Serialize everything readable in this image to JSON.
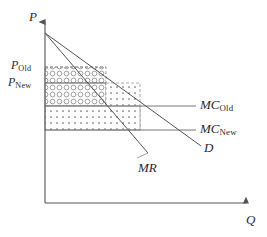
{
  "figure": {
    "type": "economics-supply-demand-diagram",
    "width": 267,
    "height": 237,
    "background_color": "#ffffff",
    "line_color": "#555555",
    "text_color": "#2b2b2b"
  },
  "axes": {
    "y_label": "P",
    "x_label": "Q",
    "origin": {
      "x": 45,
      "y": 203
    },
    "y_top": {
      "x": 45,
      "y": 18
    },
    "x_right": {
      "x": 250,
      "y": 203
    }
  },
  "curves": [
    {
      "name": "demand",
      "label": "D",
      "label_sub": "",
      "from": {
        "x": 45,
        "y": 33
      },
      "to": {
        "x": 201,
        "y": 146
      },
      "label_pos": {
        "x": 205,
        "y": 142
      }
    },
    {
      "name": "marginal-revenue",
      "label": "MR",
      "label_sub": "",
      "from": {
        "x": 45,
        "y": 33
      },
      "to": {
        "x": 148,
        "y": 153
      },
      "label_pos": {
        "x": 139,
        "y": 163
      }
    },
    {
      "name": "marginal-cost-old",
      "label": "MC",
      "label_sub": "Old",
      "y": 106,
      "from_x": 45,
      "to_x": 196,
      "label_pos": {
        "x": 200,
        "y": 99
      }
    },
    {
      "name": "marginal-cost-new",
      "label": "MC",
      "label_sub": "New",
      "y": 130,
      "from_x": 45,
      "to_x": 196,
      "label_pos": {
        "x": 200,
        "y": 123
      }
    }
  ],
  "price_levels": [
    {
      "name": "price-old",
      "label": "P",
      "label_sub": "Old",
      "y": 67,
      "label_pos": {
        "x": 11,
        "y": 60
      }
    },
    {
      "name": "price-new",
      "label": "P",
      "label_sub": "New",
      "y": 83,
      "label_pos": {
        "x": 8,
        "y": 76
      }
    }
  ],
  "regions": [
    {
      "name": "profit-lost-region",
      "pattern": "circles",
      "x": 45,
      "y": 67,
      "width": 61,
      "height": 16,
      "border": "dashed"
    },
    {
      "name": "profit-retained-region",
      "pattern": "circles",
      "x": 45,
      "y": 83,
      "width": 61,
      "height": 23,
      "border": "solid"
    },
    {
      "name": "profit-gained-right-region",
      "pattern": "dots",
      "x": 106,
      "y": 83,
      "width": 34,
      "height": 47,
      "border": "dashed"
    },
    {
      "name": "profit-gained-bottom-region",
      "pattern": "dots",
      "x": 45,
      "y": 106,
      "width": 95,
      "height": 24,
      "border": "solid"
    }
  ]
}
